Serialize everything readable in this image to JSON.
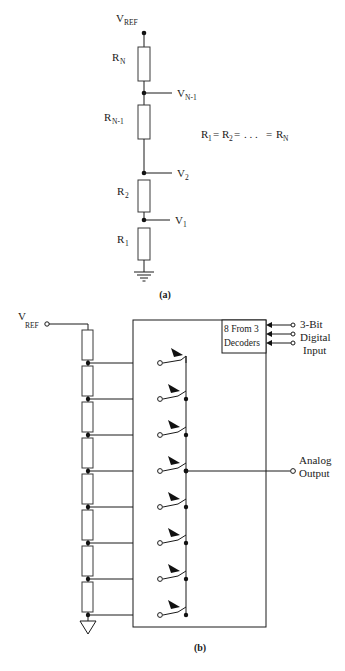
{
  "figure": {
    "title_a_caption": "(a)",
    "title_b_caption": "(b)",
    "equation": "R₁ = R₂ = . . . = RN"
  },
  "panel_a": {
    "caption": "(a)",
    "supply_label": "V",
    "supply_sub": "REF",
    "equation_main": "R",
    "equation_text": "= R",
    "resistors": [
      {
        "label": "R",
        "sub": "N"
      },
      {
        "label": "R",
        "sub": "N-1"
      },
      {
        "label": "R",
        "sub": "2"
      },
      {
        "label": "R",
        "sub": "1"
      }
    ],
    "taps": [
      {
        "label": "V",
        "sub": "N-1"
      },
      {
        "label": "V",
        "sub": "2"
      },
      {
        "label": "V",
        "sub": "1"
      }
    ],
    "eq_terms": [
      "R",
      "1",
      "R",
      "2",
      ". . .",
      "R",
      "N"
    ],
    "ground": "ground-symbol"
  },
  "panel_b": {
    "caption": "(b)",
    "supply_label": "V",
    "supply_sub": "REF",
    "decoder": {
      "line1": "8 From 3",
      "line2": "Decoders"
    },
    "digital_input": {
      "line1": "3-Bit",
      "line2": "Digital",
      "line3": "Input",
      "bit_count": 3
    },
    "analog_output": {
      "line1": "Analog",
      "line2": "Output"
    },
    "resistor_count": 8,
    "switch_count": 8,
    "ground": "triangle-ground-symbol"
  }
}
